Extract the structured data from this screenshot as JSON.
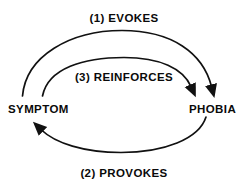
{
  "diagram": {
    "stroke_color": "#111111",
    "background_color": "#ffffff",
    "text_color": "#0a0a0a",
    "nodes": [
      {
        "id": "symptom",
        "label": "SYMPTOM",
        "x": 45,
        "y": 110
      },
      {
        "id": "phobia",
        "label": "PHOBIA",
        "x": 213,
        "y": 110
      }
    ],
    "edges": [
      {
        "id": "evokes",
        "label": "(1) EVOKES",
        "order": 1,
        "from": "symptom",
        "to": "phobia",
        "direction": "left-to-right",
        "curve": "arc-above-outer"
      },
      {
        "id": "reinforces",
        "label": "(3) REINFORCES",
        "order": 3,
        "from": "symptom",
        "to": "phobia",
        "direction": "left-to-right",
        "curve": "arc-above-inner"
      },
      {
        "id": "provokes",
        "label": "(2) PROVOKES",
        "order": 2,
        "from": "phobia",
        "to": "symptom",
        "direction": "right-to-left",
        "curve": "arc-below"
      }
    ]
  }
}
